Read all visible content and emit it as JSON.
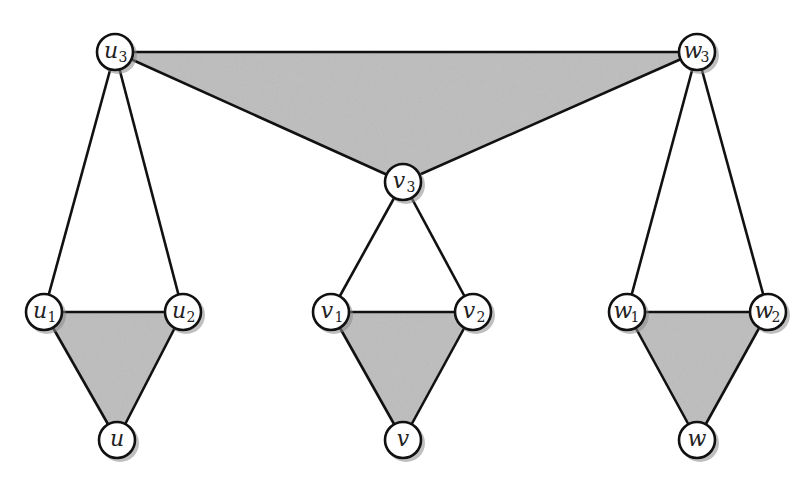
{
  "diagram": {
    "title": "",
    "node_radius": 18,
    "colors": {
      "face_fill": "#bdbdbd",
      "stroke": "#111111",
      "node_fill": "#ffffff",
      "background": "#ffffff"
    },
    "nodes": [
      {
        "id": "u3",
        "base": "u",
        "sub": "3",
        "x": 115,
        "y": 52
      },
      {
        "id": "w3",
        "base": "w",
        "sub": "3",
        "x": 697,
        "y": 52
      },
      {
        "id": "v3",
        "base": "v",
        "sub": "3",
        "x": 403,
        "y": 182
      },
      {
        "id": "u1",
        "base": "u",
        "sub": "1",
        "x": 44,
        "y": 312
      },
      {
        "id": "u2",
        "base": "u",
        "sub": "2",
        "x": 183,
        "y": 312
      },
      {
        "id": "u",
        "base": "u",
        "sub": "",
        "x": 117,
        "y": 440
      },
      {
        "id": "v1",
        "base": "v",
        "sub": "1",
        "x": 331,
        "y": 312
      },
      {
        "id": "v2",
        "base": "v",
        "sub": "2",
        "x": 473,
        "y": 312
      },
      {
        "id": "v",
        "base": "v",
        "sub": "",
        "x": 403,
        "y": 440
      },
      {
        "id": "w1",
        "base": "w",
        "sub": "1",
        "x": 627,
        "y": 312
      },
      {
        "id": "w2",
        "base": "w",
        "sub": "2",
        "x": 768,
        "y": 312
      },
      {
        "id": "w",
        "base": "w",
        "sub": "",
        "x": 697,
        "y": 440
      }
    ],
    "shaded_faces": [
      [
        "u3",
        "w3",
        "v3"
      ],
      [
        "u1",
        "u2",
        "u"
      ],
      [
        "v1",
        "v2",
        "v"
      ],
      [
        "w1",
        "w2",
        "w"
      ]
    ],
    "edges": [
      [
        "u3",
        "w3"
      ],
      [
        "u3",
        "v3"
      ],
      [
        "w3",
        "v3"
      ],
      [
        "u3",
        "u1"
      ],
      [
        "u3",
        "u2"
      ],
      [
        "v3",
        "v1"
      ],
      [
        "v3",
        "v2"
      ],
      [
        "w3",
        "w1"
      ],
      [
        "w3",
        "w2"
      ],
      [
        "u1",
        "u2"
      ],
      [
        "u1",
        "u"
      ],
      [
        "u2",
        "u"
      ],
      [
        "v1",
        "v2"
      ],
      [
        "v1",
        "v"
      ],
      [
        "v2",
        "v"
      ],
      [
        "w1",
        "w2"
      ],
      [
        "w1",
        "w"
      ],
      [
        "w2",
        "w"
      ]
    ]
  }
}
